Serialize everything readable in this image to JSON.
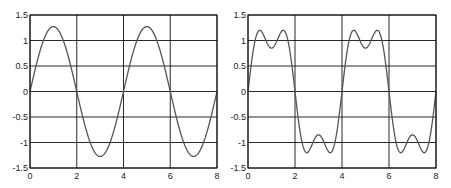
{
  "chart_data": [
    {
      "type": "line",
      "title": "",
      "xlabel": "",
      "ylabel": "",
      "xlim": [
        0,
        8
      ],
      "ylim": [
        -1.5,
        1.5
      ],
      "xticks": [
        "0",
        "2",
        "4",
        "6",
        "8"
      ],
      "yticks": [
        "1.5",
        "1",
        "0.5",
        "0",
        "-0.5",
        "-1",
        "-1.5"
      ],
      "grid": true,
      "legend": null,
      "series": [
        {
          "name": "first harmonic",
          "formula": "(4/pi)*sin(pi*x/2)",
          "x": [
            0,
            0.5,
            1,
            1.5,
            2,
            2.5,
            3,
            3.5,
            4,
            4.5,
            5,
            5.5,
            6,
            6.5,
            7,
            7.5,
            8
          ],
          "y": [
            0,
            0.9,
            1.27,
            0.9,
            0,
            -0.9,
            -1.27,
            -0.9,
            0,
            0.9,
            1.27,
            0.9,
            0,
            -0.9,
            -1.27,
            -0.9,
            0
          ],
          "color": "#555555"
        }
      ]
    },
    {
      "type": "line",
      "title": "",
      "xlabel": "",
      "ylabel": "",
      "xlim": [
        0,
        8
      ],
      "ylim": [
        -1.5,
        1.5
      ],
      "xticks": [
        "0",
        "2",
        "4",
        "6",
        "8"
      ],
      "yticks": [
        "1.5",
        "1",
        "0.5",
        "0",
        "-0.5",
        "-1",
        "-1.5"
      ],
      "grid": true,
      "legend": null,
      "series": [
        {
          "name": "first + third harmonic",
          "formula": "(4/pi)*(sin(pi*x/2) + sin(3*pi*x/2)/3)",
          "x": [
            0,
            0.5,
            1,
            1.5,
            2,
            2.5,
            3,
            3.5,
            4,
            4.5,
            5,
            5.5,
            6,
            6.5,
            7,
            7.5,
            8
          ],
          "y": [
            0,
            1.2,
            0.85,
            1.2,
            0,
            -1.2,
            -0.85,
            -1.2,
            0,
            1.2,
            0.85,
            1.2,
            0,
            -1.2,
            -0.85,
            -1.2,
            0
          ],
          "color": "#555555"
        }
      ]
    }
  ],
  "plots": [
    {
      "left": 30,
      "top": 15,
      "width": 187,
      "height": 153,
      "harmonics": [
        1
      ]
    },
    {
      "left": 248,
      "top": 15,
      "width": 188,
      "height": 153,
      "harmonics": [
        1,
        3
      ]
    }
  ],
  "style": {
    "grid_color": "#111111",
    "line_color": "#555555",
    "frame_color": "#111111"
  }
}
